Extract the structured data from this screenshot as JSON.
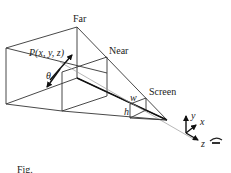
{
  "labels": {
    "far": "Far",
    "near": "Near",
    "screen": "Screen",
    "point": "P(x, y, z)",
    "theta": "θ",
    "w": "w",
    "h": "h",
    "axis_x": "x",
    "axis_y": "y",
    "axis_z": "z",
    "caption_fragment": "Fig."
  },
  "icons": {
    "eye": "eye-icon"
  },
  "colors": {
    "line": "#333333",
    "light_line": "#999999",
    "background": "#ffffff"
  }
}
